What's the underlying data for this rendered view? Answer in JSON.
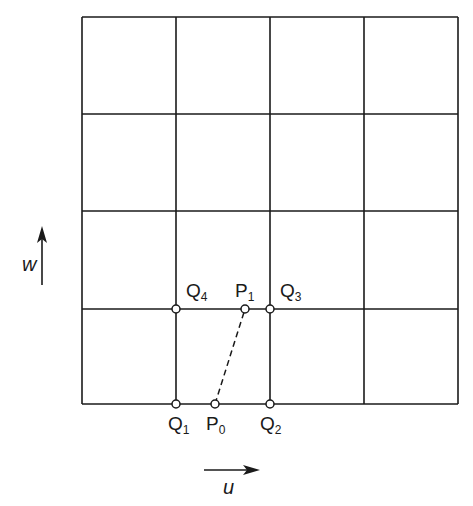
{
  "diagram": {
    "grid": {
      "columns": 4,
      "rows": 4,
      "x_lines": [
        82,
        176,
        270,
        364,
        458
      ],
      "y_lines": [
        17,
        114,
        211,
        309,
        404
      ],
      "stroke": "#1a1a1a"
    },
    "points": [
      {
        "id": "Q1",
        "base": "Q",
        "sub": "1",
        "x": 176,
        "y": 404,
        "label_x": 168,
        "label_y": 430
      },
      {
        "id": "P0",
        "base": "P",
        "sub": "0",
        "x": 215,
        "y": 404,
        "label_x": 206,
        "label_y": 430
      },
      {
        "id": "Q2",
        "base": "Q",
        "sub": "2",
        "x": 270,
        "y": 404,
        "label_x": 260,
        "label_y": 430
      },
      {
        "id": "Q3",
        "base": "Q",
        "sub": "3",
        "x": 270,
        "y": 309,
        "label_x": 280,
        "label_y": 297
      },
      {
        "id": "P1",
        "base": "P",
        "sub": "1",
        "x": 245,
        "y": 309,
        "label_x": 235,
        "label_y": 297
      },
      {
        "id": "Q4",
        "base": "Q",
        "sub": "4",
        "x": 176,
        "y": 309,
        "label_x": 186,
        "label_y": 297
      }
    ],
    "dashed_segment": {
      "from": "P0",
      "to": "P1"
    },
    "axes": {
      "u": {
        "label": "u"
      },
      "w": {
        "label": "w"
      }
    }
  }
}
